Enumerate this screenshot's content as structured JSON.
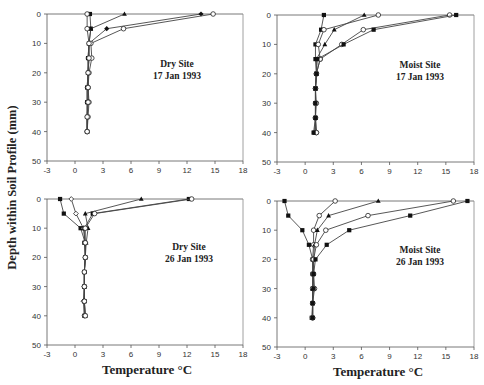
{
  "figure": {
    "ylabel": "Depth within Soil Profile (mm)",
    "xlabel": "Temperature °C"
  },
  "chart_data": [
    {
      "type": "line",
      "panel": "top-left",
      "annotation": [
        "Dry Site",
        "17 Jan 1993"
      ],
      "xlabel": "",
      "ylabel": "Depth within Soil Profile (mm)",
      "xlim": [
        -3,
        18
      ],
      "ylim": [
        50,
        0
      ],
      "xticks": [
        -3,
        0,
        3,
        6,
        9,
        12,
        15,
        18
      ],
      "yticks": [
        0,
        10,
        20,
        30,
        40,
        50
      ],
      "grid": false,
      "series": [
        {
          "marker": "filled-square",
          "x": [
            1.6,
            1.7,
            1.5,
            1.4,
            1.4,
            1.3,
            1.3,
            1.3,
            1.3
          ],
          "y": [
            0,
            5,
            10,
            15,
            20,
            25,
            30,
            35,
            40
          ]
        },
        {
          "marker": "filled-triangle",
          "x": [
            5.3,
            1.7,
            1.5,
            1.5,
            1.4,
            1.4,
            1.4,
            1.3,
            1.3
          ],
          "y": [
            0,
            5,
            10,
            15,
            20,
            25,
            30,
            35,
            40
          ]
        },
        {
          "marker": "filled-diamond",
          "x": [
            13.5,
            3.4,
            1.5,
            1.4,
            1.4,
            1.3,
            1.3,
            1.3,
            1.3
          ],
          "y": [
            0,
            5,
            10,
            15,
            20,
            25,
            30,
            35,
            40
          ]
        },
        {
          "marker": "open-circle",
          "x": [
            14.8,
            5.2,
            1.7,
            1.8,
            1.5,
            1.4,
            1.5,
            1.4,
            1.3
          ],
          "y": [
            0,
            5,
            10,
            15,
            20,
            25,
            30,
            35,
            40
          ]
        },
        {
          "marker": "open-circle-2",
          "x": [
            1.3,
            1.3,
            1.5,
            1.5,
            1.4,
            1.4,
            1.4,
            1.3,
            1.3
          ],
          "y": [
            0,
            5,
            10,
            15,
            20,
            25,
            30,
            35,
            40
          ]
        }
      ]
    },
    {
      "type": "line",
      "panel": "top-right",
      "annotation": [
        "Moist Site",
        "17 Jan 1993"
      ],
      "xlabel": "",
      "ylabel": "",
      "xlim": [
        -3,
        18
      ],
      "ylim": [
        50,
        0
      ],
      "xticks": [
        -3,
        0,
        3,
        6,
        9,
        12,
        15,
        18
      ],
      "yticks": [
        0,
        10,
        20,
        30,
        40,
        50
      ],
      "grid": false,
      "series": [
        {
          "marker": "filled-square",
          "x": [
            2.0,
            1.7,
            1.1,
            1.1,
            1.2,
            1.1,
            1.1,
            1.1,
            1.0
          ],
          "y": [
            0,
            5,
            10,
            15,
            20,
            25,
            30,
            35,
            40
          ]
        },
        {
          "marker": "filled-triangle",
          "x": [
            6.3,
            3.1,
            2.1,
            1.2,
            1.2,
            1.1,
            1.1,
            1.1,
            1.1
          ],
          "y": [
            0,
            5,
            10,
            15,
            20,
            25,
            30,
            35,
            40
          ]
        },
        {
          "marker": "open-circle",
          "x": [
            7.8,
            2.0,
            1.4,
            1.6,
            1.2,
            1.1,
            1.1,
            1.1,
            1.2
          ],
          "y": [
            0,
            5,
            10,
            15,
            20,
            25,
            30,
            35,
            40
          ]
        },
        {
          "marker": "open-circle-2",
          "x": [
            15.4,
            6.2,
            3.9,
            1.6,
            1.2,
            1.1,
            1.2,
            1.1,
            1.2
          ],
          "y": [
            0,
            5,
            10,
            15,
            20,
            25,
            30,
            35,
            40
          ]
        },
        {
          "marker": "filled-square-2",
          "x": [
            16.1,
            7.3,
            4.1,
            1.3,
            1.2,
            1.1,
            1.1,
            1.1,
            0.9
          ],
          "y": [
            0,
            5,
            10,
            15,
            20,
            25,
            30,
            35,
            40
          ]
        }
      ]
    },
    {
      "type": "line",
      "panel": "bottom-left",
      "annotation": [
        "Dry Site",
        "26 Jan 1993"
      ],
      "xlabel": "Temperature °C",
      "ylabel": "",
      "xlim": [
        -3,
        18
      ],
      "ylim": [
        50,
        0
      ],
      "xticks": [
        -3,
        0,
        3,
        6,
        9,
        12,
        15,
        18
      ],
      "yticks": [
        0,
        10,
        20,
        30,
        40,
        50
      ],
      "grid": false,
      "series": [
        {
          "marker": "filled-square",
          "x": [
            -1.6,
            -1.2,
            0.6,
            1.1,
            1.1,
            1.0,
            1.0,
            1.0,
            1.0
          ],
          "y": [
            0,
            5,
            10,
            15,
            20,
            25,
            30,
            35,
            40
          ]
        },
        {
          "marker": "open-diamond",
          "x": [
            -0.4,
            0.1,
            0.9,
            1.1,
            1.1,
            1.0,
            1.0,
            0.9,
            1.0
          ],
          "y": [
            0,
            5,
            10,
            15,
            20,
            25,
            30,
            35,
            40
          ]
        },
        {
          "marker": "filled-triangle",
          "x": [
            7.1,
            1.1,
            1.4,
            1.2,
            1.1,
            1.0,
            1.0,
            1.0,
            1.1
          ],
          "y": [
            0,
            5,
            10,
            15,
            20,
            25,
            30,
            35,
            40
          ]
        },
        {
          "marker": "filled-square-2",
          "x": [
            12.2,
            1.9,
            1.0,
            1.0,
            1.1,
            1.0,
            1.0,
            1.0,
            1.1
          ],
          "y": [
            0,
            5,
            10,
            15,
            20,
            25,
            30,
            35,
            40
          ]
        },
        {
          "marker": "open-circle",
          "x": [
            12.5,
            2.1,
            1.1,
            1.1,
            1.1,
            1.0,
            1.0,
            1.0,
            1.1
          ],
          "y": [
            0,
            5,
            10,
            15,
            20,
            25,
            30,
            35,
            40
          ]
        }
      ]
    },
    {
      "type": "line",
      "panel": "bottom-right",
      "annotation": [
        "Moist Site",
        "26 Jan 1993"
      ],
      "xlabel": "Temperature °C",
      "ylabel": "",
      "xlim": [
        -3,
        18
      ],
      "ylim": [
        50,
        0
      ],
      "xticks": [
        -3,
        0,
        3,
        6,
        9,
        12,
        15,
        18
      ],
      "yticks": [
        0,
        10,
        20,
        30,
        40,
        50
      ],
      "grid": false,
      "series": [
        {
          "marker": "filled-square",
          "x": [
            -2.2,
            -1.8,
            -0.3,
            0.4,
            0.8,
            0.8,
            0.8,
            0.8,
            0.7
          ],
          "y": [
            0,
            5,
            10,
            15,
            20,
            25,
            30,
            35,
            40
          ]
        },
        {
          "marker": "open-circle",
          "x": [
            3.2,
            1.5,
            0.9,
            0.9,
            0.8,
            0.8,
            0.8,
            0.8,
            0.8
          ],
          "y": [
            0,
            5,
            10,
            15,
            20,
            25,
            30,
            35,
            40
          ]
        },
        {
          "marker": "filled-triangle",
          "x": [
            7.8,
            2.5,
            1.3,
            1.0,
            0.9,
            0.9,
            0.8,
            0.8,
            0.8
          ],
          "y": [
            0,
            5,
            10,
            15,
            20,
            25,
            30,
            35,
            40
          ]
        },
        {
          "marker": "open-circle-2",
          "x": [
            15.8,
            6.7,
            2.2,
            1.2,
            0.9,
            0.9,
            1.0,
            0.8,
            0.8
          ],
          "y": [
            0,
            5,
            10,
            15,
            20,
            25,
            30,
            35,
            40
          ]
        },
        {
          "marker": "filled-diamond",
          "x": [
            11.2,
            4.7,
            2.3,
            1.1,
            0.9,
            0.9,
            0.9,
            0.8,
            0.8
          ],
          "y": [
            0,
            0,
            0,
            0,
            0,
            0,
            0,
            0,
            0
          ],
          "note": "placeholder"
        },
        {
          "marker": "filled-square-2",
          "x": [
            17.3,
            11.2,
            4.7,
            2.3,
            1.1,
            0.9,
            0.9,
            0.8,
            0.8
          ],
          "y": [
            0,
            5,
            10,
            15,
            20,
            25,
            30,
            35,
            40
          ]
        }
      ]
    }
  ],
  "layout": {
    "panels": [
      {
        "x0": 47,
        "x1": 243,
        "y0": 14,
        "y1": 161
      },
      {
        "x0": 277,
        "x1": 474,
        "y0": 15,
        "y1": 162
      },
      {
        "x0": 47,
        "x1": 243,
        "y0": 199,
        "y1": 345
      },
      {
        "x0": 277,
        "x1": 474,
        "y0": 201,
        "y1": 347
      }
    ],
    "annotation_pos": [
      {
        "x": 177,
        "y": 67
      },
      {
        "x": 420,
        "y": 68
      },
      {
        "x": 189,
        "y": 250
      },
      {
        "x": 420,
        "y": 253
      }
    ]
  }
}
